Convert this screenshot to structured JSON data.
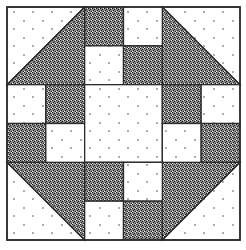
{
  "block": {
    "title": "Quilt block pattern",
    "grid": 6,
    "origin": [
      7,
      7
    ],
    "size": 233,
    "colors": {
      "light": "#ffffff",
      "dark": "#555555",
      "line": "#2b2b2b"
    }
  },
  "pieces": [
    {
      "type": "tri",
      "cells": [
        0,
        0,
        2,
        2
      ],
      "corner": "tl"
    },
    {
      "type": "tri",
      "cells": [
        4,
        0,
        2,
        2
      ],
      "corner": "tr"
    },
    {
      "type": "tri",
      "cells": [
        0,
        4,
        2,
        2
      ],
      "corner": "bl"
    },
    {
      "type": "tri",
      "cells": [
        4,
        4,
        2,
        2
      ],
      "corner": "br"
    },
    {
      "type": "sq",
      "cells": [
        2,
        0,
        1,
        1
      ],
      "fill": "dark"
    },
    {
      "type": "sq",
      "cells": [
        3,
        0,
        1,
        1
      ],
      "fill": "light"
    },
    {
      "type": "sq",
      "cells": [
        2,
        1,
        1,
        1
      ],
      "fill": "light"
    },
    {
      "type": "sq",
      "cells": [
        3,
        1,
        1,
        1
      ],
      "fill": "dark"
    },
    {
      "type": "sq",
      "cells": [
        0,
        2,
        1,
        1
      ],
      "fill": "light"
    },
    {
      "type": "sq",
      "cells": [
        1,
        2,
        1,
        1
      ],
      "fill": "dark"
    },
    {
      "type": "sq",
      "cells": [
        0,
        3,
        1,
        1
      ],
      "fill": "dark"
    },
    {
      "type": "sq",
      "cells": [
        1,
        3,
        1,
        1
      ],
      "fill": "light"
    },
    {
      "type": "sq",
      "cells": [
        2,
        2,
        2,
        2
      ],
      "fill": "light"
    },
    {
      "type": "sq",
      "cells": [
        4,
        2,
        1,
        1
      ],
      "fill": "dark"
    },
    {
      "type": "sq",
      "cells": [
        5,
        2,
        1,
        1
      ],
      "fill": "light"
    },
    {
      "type": "sq",
      "cells": [
        4,
        3,
        1,
        1
      ],
      "fill": "light"
    },
    {
      "type": "sq",
      "cells": [
        5,
        3,
        1,
        1
      ],
      "fill": "dark"
    },
    {
      "type": "sq",
      "cells": [
        2,
        4,
        1,
        1
      ],
      "fill": "dark"
    },
    {
      "type": "sq",
      "cells": [
        3,
        4,
        1,
        1
      ],
      "fill": "light"
    },
    {
      "type": "sq",
      "cells": [
        2,
        5,
        1,
        1
      ],
      "fill": "light"
    },
    {
      "type": "sq",
      "cells": [
        3,
        5,
        1,
        1
      ],
      "fill": "dark"
    }
  ]
}
